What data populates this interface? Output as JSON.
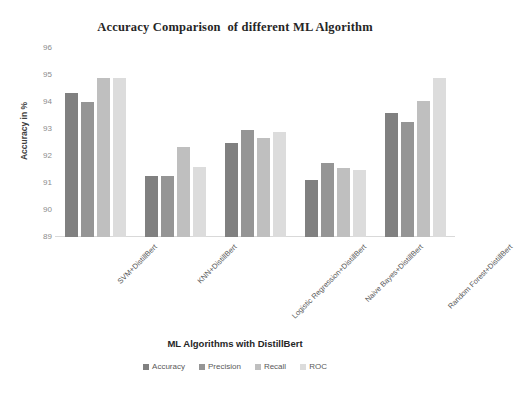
{
  "chart_data": {
    "type": "bar",
    "title": "Accuracy Comparison  of different ML Algorithm",
    "xlabel": "ML Algorithms with DistillBert",
    "ylabel": "Accuracy in %",
    "ylim": [
      89,
      96
    ],
    "yticks": [
      96,
      95,
      94,
      93,
      92,
      91,
      90,
      89
    ],
    "grid": false,
    "legend_position": "bottom",
    "categories": [
      "SVM+DistillBert",
      "KNN+DistillBert",
      "Logistic Regression+DistillBert",
      "Naive Bayes+DistillBert",
      "Random Forest+DistillBert"
    ],
    "series": [
      {
        "name": "Accuracy",
        "color": "#808080",
        "values": [
          94.35,
          91.25,
          92.5,
          91.1,
          93.6
        ]
      },
      {
        "name": "Precision",
        "color": "#959595",
        "values": [
          94.0,
          91.25,
          92.95,
          91.75,
          93.25
        ]
      },
      {
        "name": "Recall",
        "color": "#bfbfbf",
        "values": [
          94.9,
          92.35,
          92.65,
          91.55,
          94.05
        ]
      },
      {
        "name": "ROC",
        "color": "#dcdcdc",
        "values": [
          94.9,
          91.6,
          92.9,
          91.5,
          94.9
        ]
      }
    ]
  }
}
